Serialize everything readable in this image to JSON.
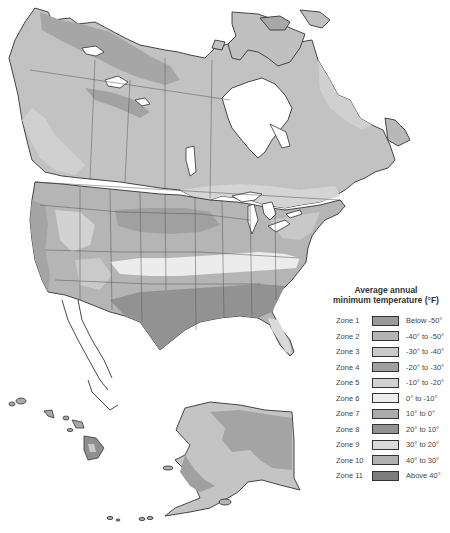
{
  "map": {
    "region": "North America hardiness zones",
    "land_colors": {
      "zone1": "#9a9a9a",
      "zone2": "#b0b0b0",
      "zone3": "#c6c6c6",
      "zone4": "#9e9e9e",
      "zone5": "#cdcdcd",
      "zone6": "#e6e6e6",
      "zone7": "#a8a8a8",
      "zone8": "#8f8f8f",
      "zone9": "#d2d2d2",
      "zone10": "#acacac",
      "zone11": "#7f7f7f",
      "water": "#ffffff",
      "border": "#333333"
    }
  },
  "legend": {
    "title_line1": "Average annual",
    "title_line2": "minimum temperature (°F)",
    "zones": [
      {
        "label": "Zone 1",
        "range": "Below -50°",
        "color": "#9a9a9a"
      },
      {
        "label": "Zone 2",
        "range": "-40° to -50°",
        "color": "#b4b4b4"
      },
      {
        "label": "Zone 3",
        "range": "-30° to -40°",
        "color": "#cacaca"
      },
      {
        "label": "Zone 4",
        "range": "-20° to -30°",
        "color": "#a0a0a0"
      },
      {
        "label": "Zone 5",
        "range": "-10° to -20°",
        "color": "#d2d2d2"
      },
      {
        "label": "Zone 6",
        "range": "0° to -10°",
        "color": "#ececec"
      },
      {
        "label": "Zone 7",
        "range": "10° to 0°",
        "color": "#acacac"
      },
      {
        "label": "Zone 8",
        "range": "20° to 10°",
        "color": "#929292"
      },
      {
        "label": "Zone 9",
        "range": "30° to 20°",
        "color": "#dadada"
      },
      {
        "label": "Zone 10",
        "range": "40° to 30°",
        "color": "#b0b0b0"
      },
      {
        "label": "Zone 11",
        "range": "Above 40°",
        "color": "#7c7c7c"
      }
    ]
  }
}
